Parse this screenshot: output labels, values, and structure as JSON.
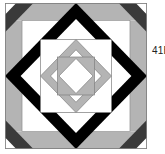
{
  "figure": {
    "type": "quilt-block-diagram",
    "label": "41B",
    "colors": {
      "background": "#ffffff",
      "black": "#000000",
      "dark_gray": "#3a3a3a",
      "light_gray": "#b4b4b4",
      "outline": "#808080"
    }
  }
}
